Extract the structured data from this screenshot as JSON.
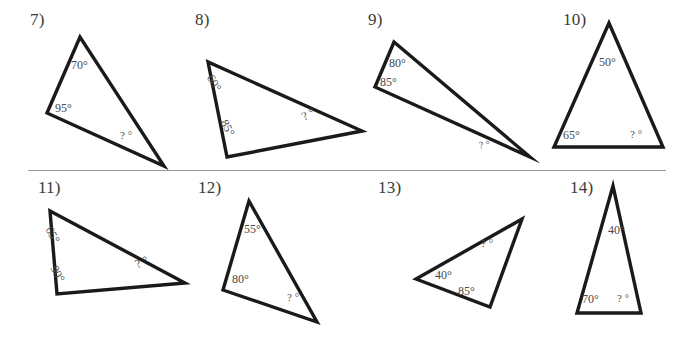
{
  "sheet": {
    "background_color": "#ffffff",
    "stroke_color": "#1a1a1a",
    "label_color": "#4a4a4a",
    "number_color": "#3a3a3a",
    "divider_color": "#9a9a9a"
  },
  "divider": {
    "label": "row-separator-line",
    "x": 28,
    "y": 170,
    "width": 638
  },
  "problems": [
    {
      "id": "p7",
      "number": "7)",
      "number_x": 30,
      "number_y": 10,
      "points": "80,37 47,113 164,166",
      "angles": [
        {
          "text": "70°",
          "x": 71,
          "y": 58,
          "rotate": 0,
          "size": 12
        },
        {
          "text": "95°",
          "x": 55,
          "y": 101,
          "rotate": 0,
          "size": 12
        },
        {
          "text": "? °",
          "x": 120,
          "y": 129,
          "rotate": 0,
          "size": 11
        }
      ]
    },
    {
      "id": "p8",
      "number": "8)",
      "number_x": 195,
      "number_y": 10,
      "points": "208,62 227,157 362,131",
      "angles": [
        {
          "text": "60°",
          "x": 216,
          "y": 72,
          "rotate": 60,
          "size": 12
        },
        {
          "text": "85°",
          "x": 230,
          "y": 117,
          "rotate": 62,
          "size": 12
        },
        {
          "text": "? °",
          "x": 299,
          "y": 111,
          "rotate": -28,
          "size": 12
        }
      ]
    },
    {
      "id": "p9",
      "number": "9)",
      "number_x": 368,
      "number_y": 10,
      "points": "394,42 375,87 530,157",
      "angles": [
        {
          "text": "80°",
          "x": 389,
          "y": 56,
          "rotate": 0,
          "size": 12
        },
        {
          "text": "85°",
          "x": 380,
          "y": 75,
          "rotate": 0,
          "size": 12
        },
        {
          "text": "? °",
          "x": 478,
          "y": 140,
          "rotate": -10,
          "size": 10
        }
      ]
    },
    {
      "id": "p10",
      "number": "10)",
      "number_x": 563,
      "number_y": 10,
      "points": "609,23 554,147 663,147",
      "angles": [
        {
          "text": "50°",
          "x": 599,
          "y": 55,
          "rotate": 0,
          "size": 12
        },
        {
          "text": "65°",
          "x": 563,
          "y": 128,
          "rotate": 0,
          "size": 12
        },
        {
          "text": "? °",
          "x": 630,
          "y": 128,
          "rotate": 0,
          "size": 11
        }
      ]
    },
    {
      "id": "p11",
      "number": "11)",
      "number_x": 38,
      "number_y": 178,
      "points": "50,211 57,294 185,283",
      "angles": [
        {
          "text": "65°",
          "x": 55,
          "y": 224,
          "rotate": 62,
          "size": 12
        },
        {
          "text": "90°",
          "x": 60,
          "y": 263,
          "rotate": 62,
          "size": 12
        },
        {
          "text": "? °",
          "x": 133,
          "y": 258,
          "rotate": -22,
          "size": 12
        }
      ]
    },
    {
      "id": "p12",
      "number": "12)",
      "number_x": 198,
      "number_y": 178,
      "points": "249,201 223,290 317,322",
      "angles": [
        {
          "text": "55°",
          "x": 244,
          "y": 222,
          "rotate": 0,
          "size": 12
        },
        {
          "text": "80°",
          "x": 232,
          "y": 272,
          "rotate": 0,
          "size": 12
        },
        {
          "text": "? °",
          "x": 287,
          "y": 291,
          "rotate": 0,
          "size": 11
        }
      ]
    },
    {
      "id": "p13",
      "number": "13)",
      "number_x": 378,
      "number_y": 178,
      "points": "416,279 522,219 490,307",
      "angles": [
        {
          "text": "? °",
          "x": 481,
          "y": 237,
          "rotate": 0,
          "size": 11
        },
        {
          "text": "40°",
          "x": 435,
          "y": 268,
          "rotate": 0,
          "size": 12
        },
        {
          "text": "85°",
          "x": 458,
          "y": 284,
          "rotate": 0,
          "size": 12
        }
      ]
    },
    {
      "id": "p14",
      "number": "14)",
      "number_x": 570,
      "number_y": 178,
      "points": "613,186 577,313 641,313",
      "angles": [
        {
          "text": "40°",
          "x": 608,
          "y": 223,
          "rotate": 0,
          "size": 12
        },
        {
          "text": "70°",
          "x": 582,
          "y": 292,
          "rotate": 0,
          "size": 12
        },
        {
          "text": "? °",
          "x": 617,
          "y": 292,
          "rotate": 0,
          "size": 11
        }
      ]
    }
  ]
}
